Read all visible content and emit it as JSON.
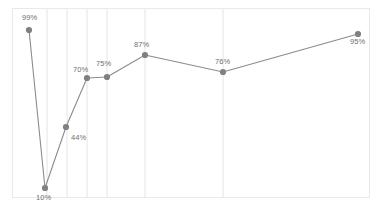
{
  "chart_data": {
    "type": "line",
    "title": "",
    "subtitle": "",
    "xlabel": "",
    "ylabel": "",
    "categories": [
      "1",
      "2",
      "3",
      "4",
      "5",
      "6",
      "7",
      "8"
    ],
    "values": [
      99,
      10,
      44,
      70,
      75,
      87,
      76,
      95
    ],
    "labels": [
      "99%",
      "10%",
      "44%",
      "70%",
      "75%",
      "87%",
      "76%",
      "95%"
    ],
    "ylim": [
      0,
      100
    ],
    "grid": true,
    "grid_orientation": "vertical",
    "legend": "none",
    "series": [
      {
        "name": "",
        "values": [
          99,
          10,
          44,
          70,
          75,
          87,
          76,
          95
        ],
        "line_color": "#8c8c8c",
        "marker_color": "#808080"
      }
    ],
    "points": [
      {
        "label": "99%",
        "value": 99,
        "x": 29,
        "y": 30,
        "label_x": 22,
        "label_y": 14
      },
      {
        "label": "10%",
        "value": 10,
        "x": 45,
        "y": 188,
        "label_x": 36,
        "label_y": 194
      },
      {
        "label": "44%",
        "value": 44,
        "x": 66,
        "y": 127,
        "label_x": 71,
        "label_y": 134
      },
      {
        "label": "70%",
        "value": 70,
        "x": 87,
        "y": 78,
        "label_x": 73,
        "label_y": 66
      },
      {
        "label": "75%",
        "value": 75,
        "x": 107,
        "y": 77,
        "label_x": 96,
        "label_y": 60
      },
      {
        "label": "87%",
        "value": 87,
        "x": 145,
        "y": 55,
        "label_x": 134,
        "label_y": 41
      },
      {
        "label": "76%",
        "value": 76,
        "x": 223,
        "y": 72,
        "label_x": 215,
        "label_y": 58
      },
      {
        "label": "95%",
        "value": 95,
        "x": 358,
        "y": 34,
        "label_x": 350,
        "label_y": 38
      }
    ],
    "gridlines_x": [
      47,
      67,
      87,
      107,
      145,
      223
    ],
    "colors": {
      "line": "#8c8c8c",
      "marker": "#808080",
      "gridline": "#e4e4e4",
      "border": "#e9e9e9",
      "label_text": "#6f6f6f",
      "background": "#ffffff"
    },
    "plot_area": {
      "left": 12,
      "top": 8,
      "width": 358,
      "height": 190
    }
  }
}
